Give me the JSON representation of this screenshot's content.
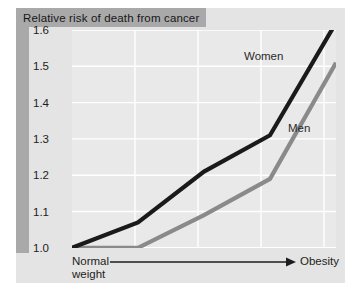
{
  "chart_data": {
    "type": "line",
    "title": "Relative risk of death from cancer",
    "xlabel_left": "Normal weight",
    "xlabel_right": "Obesity",
    "ylabel": "",
    "ylim": [
      0.97,
      1.65
    ],
    "yticks": [
      1.6,
      1.5,
      1.4,
      1.3,
      1.2,
      1.1,
      1.0
    ],
    "ytick_labels": [
      "1.6",
      "1.5",
      "1.4",
      "1.3",
      "1.2",
      "1.1",
      "1.0"
    ],
    "grid": true,
    "legend_position": "inline-annotations",
    "x": [
      0,
      1,
      2,
      3,
      4
    ],
    "xtick_labels": [
      "",
      "",
      "",
      "",
      ""
    ],
    "series": [
      {
        "name": "Women",
        "color": "#1a1a1a",
        "values": [
          1.0,
          1.07,
          1.21,
          1.31,
          1.62
        ]
      },
      {
        "name": "Men",
        "color": "#8a8a8a",
        "values": [
          1.0,
          1.0,
          1.09,
          1.19,
          1.51
        ]
      }
    ],
    "annotations": [
      {
        "text": "Women",
        "series": "Women"
      },
      {
        "text": "Men",
        "series": "Men"
      }
    ]
  },
  "colors": {
    "panel_background": "#e4e4e4",
    "plot_background": "#e9e9e9",
    "band": "#a9a9a9",
    "gridline": "#ffffff",
    "women_line": "#1a1a1a",
    "men_line": "#8a8a8a",
    "text": "#1d1d20"
  }
}
